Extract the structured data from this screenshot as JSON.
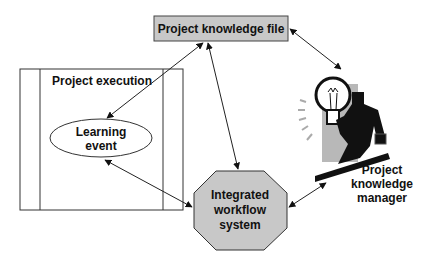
{
  "diagram": {
    "nodes": {
      "knowledge_file": {
        "label": "Project knowledge file",
        "fill": "#c8c8c8"
      },
      "project_execution": {
        "label": "Project execution"
      },
      "learning_event": {
        "label_line1": "Learning",
        "label_line2": "event"
      },
      "workflow_system": {
        "label_line1": "Integrated",
        "label_line2": "workflow",
        "label_line3": "system",
        "fill": "#c8c8c8"
      },
      "knowledge_manager": {
        "label_line1": "Project",
        "label_line2": "knowledge",
        "label_line3": "manager",
        "icon": "lightbulb-businessman-icon"
      }
    },
    "edges": [
      {
        "from": "knowledge_file",
        "to": "learning_event",
        "bidirectional": true
      },
      {
        "from": "knowledge_file",
        "to": "workflow_system",
        "bidirectional": true
      },
      {
        "from": "knowledge_file",
        "to": "knowledge_manager",
        "bidirectional": true
      },
      {
        "from": "learning_event",
        "to": "workflow_system",
        "bidirectional": true
      },
      {
        "from": "workflow_system",
        "to": "knowledge_manager",
        "bidirectional": true
      }
    ]
  }
}
